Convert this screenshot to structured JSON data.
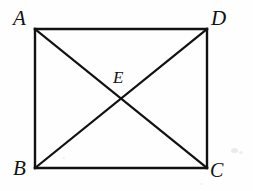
{
  "figure": {
    "type": "geometry-diagram",
    "background_color": "#fefefe",
    "stroke_color": "#111111",
    "stroke_width": 2.2,
    "canvas": {
      "width": 253,
      "height": 191
    },
    "vertices": [
      {
        "id": "A",
        "label": "A",
        "x": 35,
        "y": 29,
        "label_x": 13,
        "label_y": 8,
        "position": "top-left"
      },
      {
        "id": "D",
        "label": "D",
        "x": 207,
        "y": 29,
        "label_x": 211,
        "label_y": 8,
        "position": "top-right"
      },
      {
        "id": "B",
        "label": "B",
        "x": 35,
        "y": 168,
        "label_x": 13,
        "label_y": 158,
        "position": "bottom-left"
      },
      {
        "id": "C",
        "label": "C",
        "x": 207,
        "y": 168,
        "label_x": 210,
        "label_y": 160,
        "position": "bottom-right"
      },
      {
        "id": "E",
        "label": "E",
        "x": 121,
        "y": 98,
        "label_x": 113,
        "label_y": 69,
        "position": "center-intersection"
      }
    ],
    "edges": [
      {
        "id": "AD",
        "from": "A",
        "to": "D",
        "kind": "side"
      },
      {
        "id": "DC",
        "from": "D",
        "to": "C",
        "kind": "side"
      },
      {
        "id": "CB",
        "from": "C",
        "to": "B",
        "kind": "side"
      },
      {
        "id": "BA",
        "from": "B",
        "to": "A",
        "kind": "side"
      },
      {
        "id": "AC",
        "from": "A",
        "to": "C",
        "kind": "diagonal"
      },
      {
        "id": "BD",
        "from": "B",
        "to": "D",
        "kind": "diagonal"
      }
    ],
    "artifacts": [
      {
        "id": "speck-1",
        "x": 231,
        "y": 148
      },
      {
        "id": "speck-2",
        "x": 239,
        "y": 151
      },
      {
        "id": "speck-3",
        "x": 62,
        "y": 157
      },
      {
        "id": "speck-4",
        "x": 200,
        "y": 183
      }
    ]
  }
}
